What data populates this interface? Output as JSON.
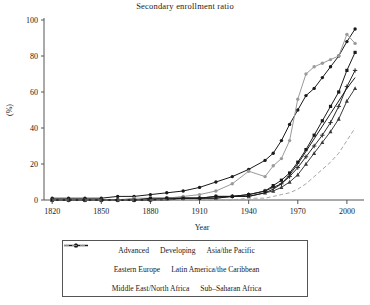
{
  "chart_data": {
    "type": "line",
    "title": "Secondary enrollment ratio",
    "xlabel": "Year",
    "ylabel": "(%)",
    "xlim": [
      1815,
      2008
    ],
    "ylim": [
      0,
      100
    ],
    "xticks": [
      1820,
      1850,
      1880,
      1910,
      1940,
      1970,
      2000
    ],
    "yticks": [
      0,
      20,
      40,
      60,
      80,
      100
    ],
    "grid": false,
    "legend_position": "below-outside",
    "x": [
      1820,
      1830,
      1840,
      1850,
      1860,
      1870,
      1880,
      1890,
      1900,
      1910,
      1920,
      1930,
      1940,
      1950,
      1955,
      1960,
      1965,
      1970,
      1975,
      1980,
      1985,
      1990,
      1995,
      2000,
      2005
    ],
    "series": [
      {
        "name": "Advanced",
        "color": "#1a1a1a",
        "marker": "circle",
        "dash": "solid",
        "values": [
          1,
          1,
          1,
          1,
          2,
          2,
          3,
          4,
          5,
          7,
          10,
          13,
          17,
          22,
          26,
          33,
          42,
          50,
          58,
          62,
          68,
          74,
          80,
          88,
          95
        ]
      },
      {
        "name": "Developing",
        "color": "#3a3a3a",
        "marker": "triangle",
        "dash": "solid",
        "values": [
          0,
          0,
          0,
          0,
          0,
          0,
          0,
          1,
          1,
          1,
          1,
          2,
          2,
          4,
          5,
          7,
          10,
          14,
          20,
          26,
          32,
          38,
          45,
          55,
          62
        ]
      },
      {
        "name": "Asia/the Pacific",
        "color": "#2a2a2a",
        "marker": "plus",
        "dash": "solid",
        "values": [
          0,
          0,
          0,
          0,
          0,
          0,
          0,
          1,
          1,
          1,
          2,
          2,
          3,
          5,
          7,
          9,
          13,
          18,
          24,
          30,
          36,
          43,
          52,
          63,
          72
        ]
      },
      {
        "name": "Eastern Europe",
        "color": "#9a9a9a",
        "marker": "circle",
        "dash": "solid",
        "values": [
          0,
          0,
          0,
          0,
          0,
          1,
          1,
          1,
          2,
          3,
          5,
          9,
          16,
          13,
          19,
          23,
          33,
          56,
          70,
          74,
          76,
          78,
          80,
          92,
          87
        ]
      },
      {
        "name": "Latin America/the Caribbean",
        "color": "#1a1a1a",
        "marker": "square",
        "dash": "solid",
        "values": [
          0,
          0,
          0,
          0,
          0,
          0,
          1,
          1,
          1,
          1,
          2,
          2,
          3,
          5,
          8,
          11,
          15,
          21,
          28,
          36,
          44,
          52,
          60,
          72,
          82
        ]
      },
      {
        "name": "Middle East/North Africa",
        "color": "#1a1a1a",
        "marker": "none",
        "dash": "solid",
        "values": [
          0,
          0,
          0,
          0,
          0,
          0,
          0,
          0,
          1,
          1,
          1,
          2,
          2,
          4,
          6,
          9,
          14,
          20,
          27,
          34,
          41,
          48,
          55,
          62,
          68
        ]
      },
      {
        "name": "Sub-Saharan Africa",
        "color": "#9a9a9a",
        "marker": "none",
        "dash": "dashed",
        "values": [
          0,
          0,
          0,
          0,
          0,
          0,
          0,
          0,
          0,
          0,
          0,
          0,
          1,
          1,
          2,
          3,
          4,
          6,
          9,
          13,
          17,
          21,
          26,
          33,
          40
        ]
      }
    ]
  },
  "legend": {
    "rows": [
      [
        {
          "label": "Advanced",
          "series": 0
        },
        {
          "label": "Developing",
          "series": 1
        },
        {
          "label": "Asia/the Pacific",
          "series": 2
        }
      ],
      [
        {
          "label": "Eastern Europe",
          "series": 3
        },
        {
          "label": "Latin America/the Caribbean",
          "series": 4
        }
      ],
      [
        {
          "label": "Middle East/North Africa",
          "series": 5
        },
        {
          "label": "Sub–Saharan Africa",
          "series": 6
        }
      ]
    ]
  }
}
